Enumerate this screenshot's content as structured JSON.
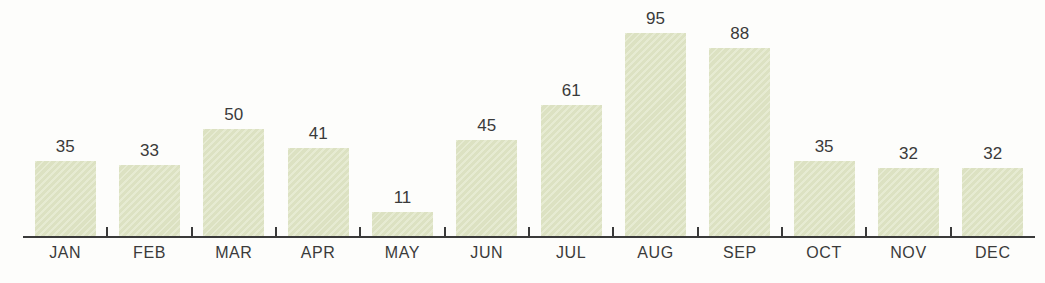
{
  "chart_data": {
    "type": "bar",
    "categories": [
      "JAN",
      "FEB",
      "MAR",
      "APR",
      "MAY",
      "JUN",
      "JUL",
      "AUG",
      "SEP",
      "OCT",
      "NOV",
      "DEC"
    ],
    "values": [
      35,
      33,
      50,
      41,
      11,
      45,
      61,
      95,
      88,
      35,
      32,
      32
    ],
    "title": "",
    "xlabel": "",
    "ylabel": "",
    "ylim": [
      0,
      100
    ],
    "grid": false,
    "legend": null,
    "data_labels": true,
    "bar_color": "#dfe5c5",
    "axis_color": "#3a3a3a",
    "label_color": "#3a3a3a",
    "background_color": "#fdfdfb"
  }
}
